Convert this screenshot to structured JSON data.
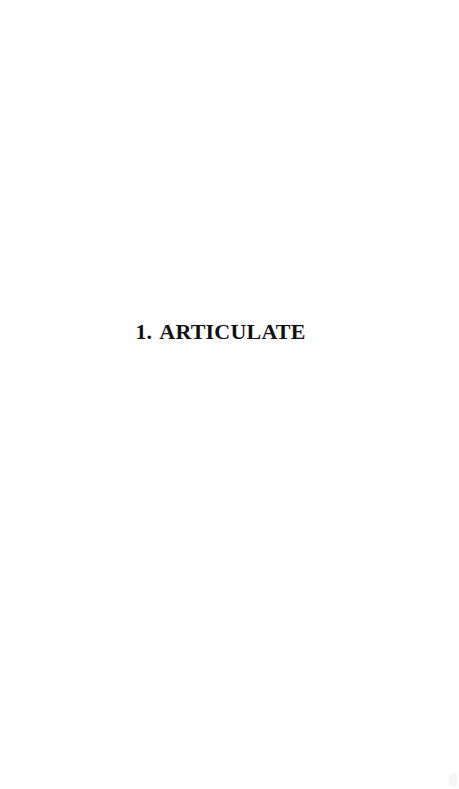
{
  "page": {
    "background": "#ffffff"
  },
  "heading": {
    "number": "1.",
    "title": "ARTICULATE",
    "color": "#111111"
  }
}
